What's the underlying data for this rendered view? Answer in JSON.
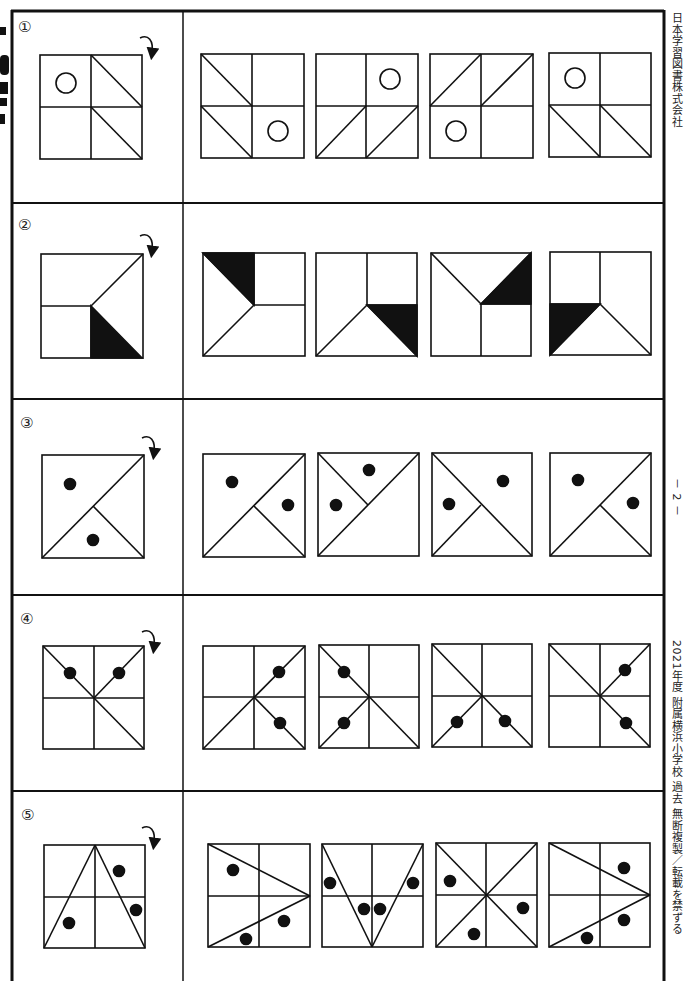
{
  "page": {
    "page_number": "－ 2 －",
    "publisher": "日本学習図書株式会社",
    "footer_notice": "2021年度 附属横浜小学校 過去 無断複製／転載を禁ずる"
  },
  "instruction_icon": "rotate-clockwise-arrow-icon",
  "questions": [
    {
      "number": "①",
      "example": {
        "cells": "2x2 grid",
        "marks": [
          "circle top-left",
          "diagonal top-right",
          "diagonal bottom-right"
        ]
      },
      "options": [
        {
          "index": 1,
          "desc": "grid; diagonals top-left & bottom-left; circle bottom-right"
        },
        {
          "index": 2,
          "desc": "grid; anti-diagonals bottom-left & bottom-right; circle top-right"
        },
        {
          "index": 3,
          "desc": "grid; anti-diagonals top-left & top-right; circle bottom-left"
        },
        {
          "index": 4,
          "desc": "grid; diagonals bottom-left & bottom-right; circle top-left"
        }
      ]
    },
    {
      "number": "②",
      "example": {
        "desc": "black triangle bottom-right quadrant"
      },
      "options": [
        {
          "index": 1,
          "desc": "black triangle top-left"
        },
        {
          "index": 2,
          "desc": "black triangle bottom-right"
        },
        {
          "index": 3,
          "desc": "black triangle top-right"
        },
        {
          "index": 4,
          "desc": "black triangle bottom-left"
        }
      ]
    },
    {
      "number": "③",
      "example": {
        "desc": "diagonal with branch, two dots"
      },
      "options": [
        {
          "index": 1,
          "desc": "option 1"
        },
        {
          "index": 2,
          "desc": "option 2"
        },
        {
          "index": 3,
          "desc": "option 3"
        },
        {
          "index": 4,
          "desc": "option 4"
        }
      ]
    },
    {
      "number": "④",
      "example": {
        "desc": "grid with three rays, two dots"
      },
      "options": [
        {
          "index": 1,
          "desc": "option 1"
        },
        {
          "index": 2,
          "desc": "option 2"
        },
        {
          "index": 3,
          "desc": "option 3"
        },
        {
          "index": 4,
          "desc": "option 4"
        }
      ]
    },
    {
      "number": "⑤",
      "example": {
        "desc": "grid with triangle, three dots"
      },
      "options": [
        {
          "index": 1,
          "desc": "option 1"
        },
        {
          "index": 2,
          "desc": "option 2"
        },
        {
          "index": 3,
          "desc": "option 3"
        },
        {
          "index": 4,
          "desc": "option 4"
        }
      ]
    }
  ]
}
